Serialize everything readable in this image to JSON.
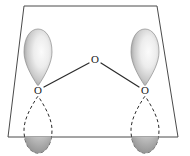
{
  "figure": {
    "background_color": "#ffffff",
    "plane": {
      "name": "molecular-plane",
      "shape": "trapezoid",
      "stroke_color": "#4a4a4a",
      "points": "24,6 157,6 178,137 8,137"
    },
    "atoms": [
      {
        "id": "o-left",
        "label": "O",
        "x": 38,
        "y": 91
      },
      {
        "id": "o-center",
        "label": "O",
        "x": 95,
        "y": 60
      },
      {
        "id": "o-right",
        "label": "O",
        "x": 145,
        "y": 91
      }
    ],
    "bonds": [
      {
        "id": "bond-left",
        "from": "o-left",
        "to": "o-center",
        "x1": 44,
        "y1": 87,
        "x2": 89,
        "y2": 63
      },
      {
        "id": "bond-right",
        "from": "o-center",
        "to": "o-right",
        "x1": 101,
        "y1": 63,
        "x2": 139,
        "y2": 87
      }
    ],
    "orbitals": [
      {
        "id": "p-orbital-left",
        "atom": "o-left",
        "upper_lobe": {
          "style": "shaded",
          "fill_light": "#f2f2f2",
          "fill_dark": "#8e8e8e"
        },
        "lower_lobe": {
          "style": "dashed-hidden",
          "stroke": "#2b2b2b"
        },
        "lower_cap": {
          "style": "shaded",
          "fill_light": "#e9e9e9",
          "fill_dark": "#8a8a8a"
        }
      },
      {
        "id": "p-orbital-right",
        "atom": "o-right",
        "upper_lobe": {
          "style": "shaded",
          "fill_light": "#f2f2f2",
          "fill_dark": "#8e8e8e"
        },
        "lower_lobe": {
          "style": "dashed-hidden",
          "stroke": "#2b2b2b"
        },
        "lower_cap": {
          "style": "shaded",
          "fill_light": "#e9e9e9",
          "fill_dark": "#8a8a8a"
        }
      }
    ],
    "colors": {
      "line": "#2b2b2b",
      "plane_line": "#4a4a4a",
      "lobe_light": "#f2f2f2",
      "lobe_dark": "#8e8e8e",
      "label": "#1a1a1a"
    }
  }
}
